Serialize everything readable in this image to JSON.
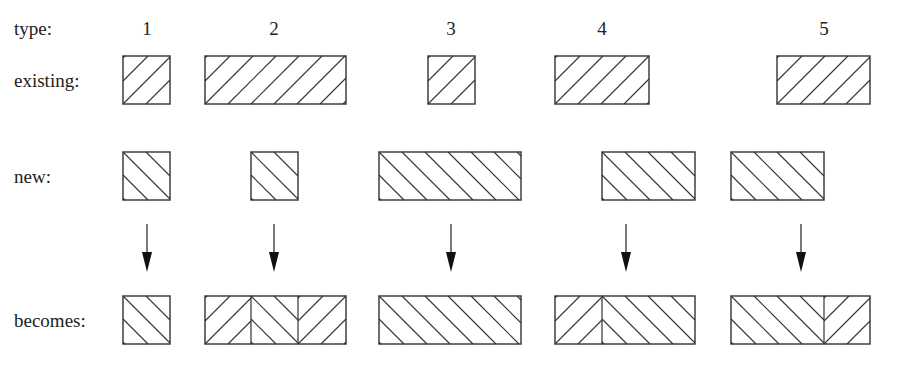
{
  "diagram": {
    "row_labels": {
      "type": "type:",
      "existing": "existing:",
      "new": "new:",
      "becomes": "becomes:"
    },
    "types": [
      {
        "label": "1",
        "label_x": 147,
        "existing": {
          "x1": 123,
          "x2": 170
        },
        "new": {
          "x1": 123,
          "x2": 170
        },
        "arrow_x": 147,
        "becomes": [
          {
            "x1": 123,
            "x2": 170,
            "hatch": "new"
          }
        ]
      },
      {
        "label": "2",
        "label_x": 274,
        "existing": {
          "x1": 205,
          "x2": 346
        },
        "new": {
          "x1": 251,
          "x2": 298
        },
        "arrow_x": 274,
        "becomes": [
          {
            "x1": 205,
            "x2": 251,
            "hatch": "existing"
          },
          {
            "x1": 251,
            "x2": 298,
            "hatch": "new"
          },
          {
            "x1": 298,
            "x2": 346,
            "hatch": "existing"
          }
        ]
      },
      {
        "label": "3",
        "label_x": 451,
        "existing": {
          "x1": 428,
          "x2": 475
        },
        "new": {
          "x1": 379,
          "x2": 521
        },
        "arrow_x": 451,
        "becomes": [
          {
            "x1": 379,
            "x2": 521,
            "hatch": "new"
          }
        ]
      },
      {
        "label": "4",
        "label_x": 602,
        "existing": {
          "x1": 555,
          "x2": 649
        },
        "new": {
          "x1": 602,
          "x2": 695
        },
        "arrow_x": 626,
        "becomes": [
          {
            "x1": 555,
            "x2": 602,
            "hatch": "existing"
          },
          {
            "x1": 602,
            "x2": 695,
            "hatch": "new"
          }
        ]
      },
      {
        "label": "5",
        "label_x": 824,
        "existing": {
          "x1": 777,
          "x2": 870
        },
        "new": {
          "x1": 731,
          "x2": 824
        },
        "arrow_x": 801,
        "becomes": [
          {
            "x1": 731,
            "x2": 824,
            "hatch": "new"
          },
          {
            "x1": 824,
            "x2": 870,
            "hatch": "existing"
          }
        ]
      }
    ],
    "legend": {
      "existing_hatch": "forward-diagonal",
      "new_hatch": "back-diagonal"
    },
    "colors": {
      "stroke": "#333333",
      "text": "#222222",
      "background": "#ffffff"
    }
  }
}
